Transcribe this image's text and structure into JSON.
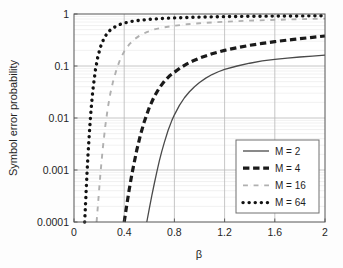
{
  "figure": {
    "background_color": "#fdfdfd",
    "plot_area": {
      "left": 74,
      "top": 14,
      "right": 325,
      "bottom": 222
    },
    "axis_color": "#555555",
    "grid_color": "#b8b8b8",
    "minor_grid_color": "#e2e2e2"
  },
  "chart_data": {
    "type": "line",
    "title": "",
    "xlabel": "β",
    "ylabel": "Symbol error probability",
    "xlim": [
      0,
      2
    ],
    "ylim": [
      0.0001,
      1
    ],
    "yscale": "log",
    "xscale": "linear",
    "grid": true,
    "legend_position": "lower right",
    "xticks": [
      0,
      0.4,
      0.8,
      1.2,
      1.6,
      2
    ],
    "xtick_labels": [
      "0",
      "0.4",
      "0.8",
      "1.2",
      "1.6",
      "2"
    ],
    "yticks": [
      1,
      0.1,
      0.01,
      0.001,
      0.0001
    ],
    "ytick_labels": [
      "1",
      "0.1",
      "0.01",
      "0.001",
      "0.0001"
    ],
    "series": [
      {
        "name": "M=2",
        "color": "#4a4a4a",
        "style": "solid",
        "width": 1.3,
        "x": [
          0.58,
          0.6,
          0.62,
          0.64,
          0.66,
          0.68,
          0.7,
          0.72,
          0.75,
          0.78,
          0.8,
          0.84,
          0.88,
          0.92,
          0.96,
          1.0,
          1.05,
          1.1,
          1.15,
          1.2,
          1.3,
          1.4,
          1.5,
          1.6,
          1.7,
          1.8,
          1.9,
          2.0
        ],
        "y": [
          0.0001,
          0.00018,
          0.00032,
          0.00055,
          0.00092,
          0.0015,
          0.0023,
          0.0034,
          0.0058,
          0.009,
          0.0115,
          0.0175,
          0.0245,
          0.032,
          0.04,
          0.048,
          0.0585,
          0.0685,
          0.0775,
          0.086,
          0.1,
          0.113,
          0.125,
          0.134,
          0.142,
          0.149,
          0.155,
          0.162
        ]
      },
      {
        "name": "M=4",
        "color": "#1a1a1a",
        "style": "dashed",
        "width": 3.2,
        "x": [
          0.4,
          0.42,
          0.44,
          0.46,
          0.48,
          0.5,
          0.53,
          0.56,
          0.6,
          0.64,
          0.68,
          0.72,
          0.76,
          0.8,
          0.85,
          0.9,
          0.95,
          1.0,
          1.1,
          1.2,
          1.3,
          1.4,
          1.5,
          1.6,
          1.75,
          1.9,
          2.0
        ],
        "y": [
          0.0001,
          0.00021,
          0.00042,
          0.0008,
          0.0014,
          0.0024,
          0.0048,
          0.0085,
          0.016,
          0.026,
          0.038,
          0.051,
          0.064,
          0.076,
          0.093,
          0.11,
          0.126,
          0.142,
          0.172,
          0.2,
          0.225,
          0.25,
          0.272,
          0.294,
          0.325,
          0.356,
          0.378
        ]
      },
      {
        "name": "M=16",
        "color": "#b0b0b0",
        "style": "dashdot",
        "width": 1.9,
        "x": [
          0.18,
          0.19,
          0.2,
          0.21,
          0.22,
          0.23,
          0.25,
          0.27,
          0.29,
          0.31,
          0.34,
          0.37,
          0.4,
          0.44,
          0.48,
          0.52,
          0.58,
          0.64,
          0.7,
          0.8,
          0.9,
          1.0,
          1.2,
          1.4,
          1.6,
          1.8,
          2.0
        ],
        "y": [
          0.0001,
          0.0002,
          0.00041,
          0.00082,
          0.0015,
          0.0027,
          0.0072,
          0.016,
          0.03,
          0.049,
          0.088,
          0.138,
          0.19,
          0.26,
          0.325,
          0.38,
          0.45,
          0.505,
          0.545,
          0.595,
          0.635,
          0.665,
          0.71,
          0.745,
          0.772,
          0.795,
          0.815
        ]
      },
      {
        "name": "M=64",
        "color": "#121212",
        "style": "dotted",
        "width": 3.4,
        "x": [
          0.085,
          0.09,
          0.095,
          0.1,
          0.105,
          0.11,
          0.12,
          0.13,
          0.14,
          0.15,
          0.17,
          0.19,
          0.21,
          0.24,
          0.27,
          0.3,
          0.35,
          0.4,
          0.46,
          0.52,
          0.6,
          0.7,
          0.8,
          0.95,
          1.1,
          1.3,
          1.5,
          1.7,
          1.85,
          2.0
        ],
        "y": [
          0.0001,
          0.00018,
          0.00032,
          0.00058,
          0.001,
          0.0017,
          0.0042,
          0.0095,
          0.019,
          0.034,
          0.082,
          0.15,
          0.23,
          0.345,
          0.445,
          0.52,
          0.61,
          0.67,
          0.72,
          0.755,
          0.79,
          0.82,
          0.842,
          0.865,
          0.882,
          0.898,
          0.908,
          0.916,
          0.92,
          0.925
        ]
      }
    ]
  },
  "legend": {
    "box": {
      "x": 236,
      "y": 140,
      "w": 83,
      "h": 73
    },
    "border_color": "#707070",
    "fill": "#ffffff",
    "entries": [
      {
        "label": "M = 2"
      },
      {
        "label": "M = 4"
      },
      {
        "label": "M = 16"
      },
      {
        "label": "M = 64"
      }
    ]
  }
}
